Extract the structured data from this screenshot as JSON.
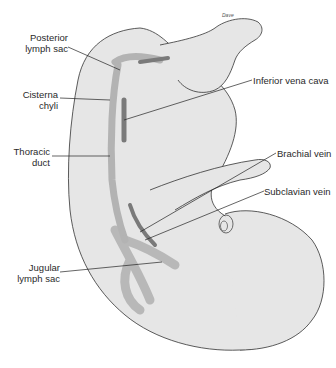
{
  "figure": {
    "signature": "Dave",
    "colors": {
      "background": "#ffffff",
      "body_fill": "#e6e6e6",
      "outline": "#333333",
      "lymph": "#b3b3b3",
      "vein": "#7a7a7a",
      "leader": "#222222"
    }
  },
  "labels": {
    "posterior_lymph_sac": [
      "Posterior",
      "lymph sac"
    ],
    "cisterna_chyli": [
      "Cisterna",
      "chyli"
    ],
    "thoracic_duct": [
      "Thoracic",
      "duct"
    ],
    "jugular_lymph_sac": [
      "Jugular",
      "lymph sac"
    ],
    "inferior_vena_cava": "Inferior vena cava",
    "brachial_vein": "Brachial vein",
    "subclavian_vein": "Subclavian vein"
  }
}
